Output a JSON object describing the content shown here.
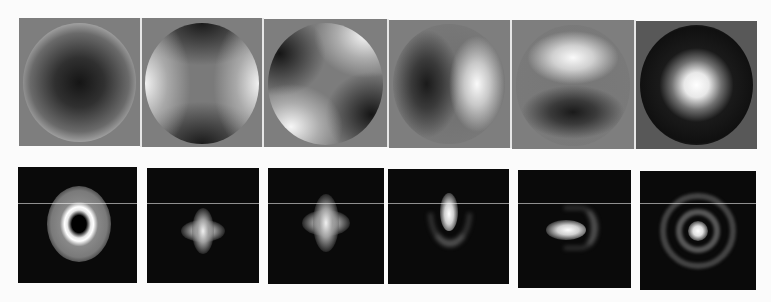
{
  "figure": {
    "colors": {
      "page_background": "#fbfbfb",
      "phase_background": "#7e7e7e",
      "psf_background": "#0a0a0a"
    },
    "phase_maps": [
      {
        "name": "defocus",
        "pattern": "radial-dark-center-bright-rim"
      },
      {
        "name": "astigmatism-0",
        "pattern": "bright-left-right-dark-top-bottom"
      },
      {
        "name": "astigmatism-45",
        "pattern": "diagonal-saddle"
      },
      {
        "name": "coma-x",
        "pattern": "bright-right-dark-left"
      },
      {
        "name": "coma-y",
        "pattern": "bright-top-dark-bottom"
      },
      {
        "name": "spherical",
        "pattern": "bright-center-dark-ring-bright-rim"
      }
    ],
    "psfs": [
      {
        "name": "defocus-psf",
        "pattern": "donut"
      },
      {
        "name": "astigmatism-0-psf",
        "pattern": "cross"
      },
      {
        "name": "astigmatism-45-psf",
        "pattern": "cross"
      },
      {
        "name": "coma-y-psf",
        "pattern": "comet-up-with-arc-below"
      },
      {
        "name": "coma-x-psf",
        "pattern": "comet-left-with-arc-right"
      },
      {
        "name": "spherical-psf",
        "pattern": "central-spot-with-rings"
      }
    ]
  }
}
